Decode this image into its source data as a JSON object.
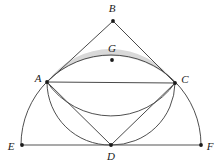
{
  "figure": {
    "background_color": "#ffffff",
    "shade_color": "#d9d9d9",
    "curve_color": "#3b3b3b",
    "line_color": "#555555",
    "label_color": "#1a1a1a",
    "width": 222,
    "height": 166
  },
  "points": [
    {
      "id": "A",
      "label": "A",
      "x": 47,
      "y": 82,
      "label_x": 38,
      "label_y": 79,
      "has_dot": true
    },
    {
      "id": "B",
      "label": "B",
      "x": 113,
      "y": 21,
      "label_x": 112,
      "label_y": 9,
      "has_dot": true
    },
    {
      "id": "C",
      "label": "C",
      "x": 175,
      "y": 83,
      "label_x": 185,
      "label_y": 80,
      "has_dot": true
    },
    {
      "id": "D",
      "label": "D",
      "x": 111,
      "y": 145,
      "label_x": 111,
      "label_y": 157,
      "has_dot": true
    },
    {
      "id": "E",
      "label": "E",
      "x": 22,
      "y": 145,
      "label_x": 11,
      "label_y": 147,
      "has_dot": true
    },
    {
      "id": "F",
      "label": "F",
      "x": 201,
      "y": 145,
      "label_x": 210,
      "label_y": 147,
      "has_dot": true
    },
    {
      "id": "G",
      "label": "G",
      "x": 112,
      "y": 60,
      "label_x": 112,
      "label_y": 49,
      "has_dot": true
    }
  ],
  "segments": [
    {
      "id": "AC",
      "from": "A",
      "to": "C",
      "kind": "chord"
    },
    {
      "id": "AB",
      "from": "A",
      "to": "B",
      "kind": "chord"
    },
    {
      "id": "BC",
      "from": "B",
      "to": "C",
      "kind": "chord"
    },
    {
      "id": "AD",
      "from": "A",
      "to": "D",
      "kind": "chord"
    },
    {
      "id": "CD",
      "from": "C",
      "to": "D",
      "kind": "chord"
    },
    {
      "id": "EF",
      "from": "E",
      "to": "F",
      "kind": "baseline"
    }
  ],
  "arcs": [
    {
      "id": "semicircle-EABCF",
      "description": "large semicircle from E through A, B, C to F centered at D",
      "center": "D",
      "radius": 90
    },
    {
      "id": "circle-ADC",
      "description": "circle through A, D and C",
      "center_x": 111,
      "radius": 63
    },
    {
      "id": "arc-AGC",
      "description": "lower boundary arc of shaded lune through A, G, C"
    }
  ],
  "shaded_regions": [
    {
      "id": "lune-ABC",
      "description": "region between arc A-B-C and arc A-G-C",
      "color": "#d9d9d9"
    }
  ],
  "paths": {
    "shaded_lune": "M 47 82 A 90 90 0 0 1 175 83 A 78 78 0 0 0 47 82 Z",
    "outer_semicircle": "M 21 145 A 90 90 0 0 1 201 145",
    "inner_circle_upper": "M 47 82 A 78 78 0 0 0 175 83",
    "inner_circle_lower_left": "M 47 82 A 63 63 0 0 0 111 145",
    "inner_circle_lower_right": "M 111 145 A 63 63 0 0 0 175 83"
  }
}
